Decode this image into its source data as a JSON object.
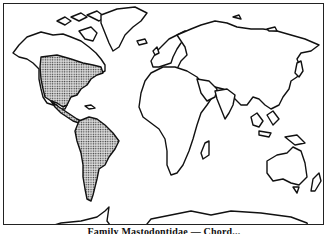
{
  "map": {
    "type": "world outline distribution map",
    "highlighted_regions": [
      "North America (central and eastern)",
      "Central America",
      "South America"
    ],
    "pattern": "stippled",
    "border_color": "#222222",
    "fill_color": "#999999"
  },
  "caption": {
    "text": "Family Mastodontidae — Chord..."
  }
}
